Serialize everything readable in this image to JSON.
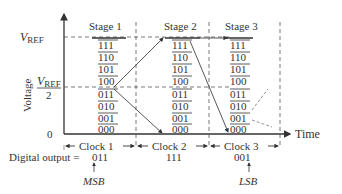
{
  "diagram": {
    "y_axis_label": "Voltage",
    "x_axis_label": "Time",
    "vref_label": "V",
    "vref_sub": "REF",
    "half_den": "2",
    "zero_label": "0",
    "stages": [
      {
        "label": "Stage 1",
        "clock": "Clock 1",
        "output": "011"
      },
      {
        "label": "Stage 2",
        "clock": "Clock 2",
        "output": "111"
      },
      {
        "label": "Stage 3",
        "clock": "Clock 3",
        "output": "001"
      }
    ],
    "codes": [
      "111",
      "110",
      "101",
      "100",
      "011",
      "010",
      "001",
      "000"
    ],
    "digital_output_prefix": "Digital output = ",
    "msb_label": "MSB",
    "lsb_label": "LSB"
  }
}
